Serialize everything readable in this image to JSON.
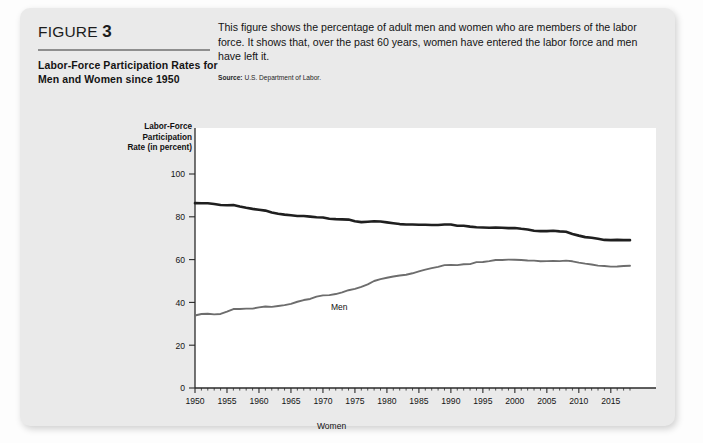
{
  "figure": {
    "kicker_label": "FIGURE",
    "kicker_number": "3",
    "title": "Labor-Force Participation Rates for Men and Women since 1950",
    "blurb": "This figure shows the percentage of adult men and women who are members of the labor force. It shows that, over the past 60 years, women have entered the labor force and men have left it.",
    "source_label": "Source:",
    "source_text": "U.S. Department of Labor."
  },
  "chart_data": {
    "type": "line",
    "title": "Labor-Force Participation Rates for Men and Women since 1950",
    "xlabel": "",
    "ylabel": "Labor-Force Participation Rate (in percent)",
    "ylabel_lines": [
      "Labor-Force",
      "Participation",
      "Rate (in percent)"
    ],
    "xlim": [
      1950,
      2018
    ],
    "ylim": [
      0,
      100
    ],
    "yticks": [
      0,
      20,
      40,
      60,
      80,
      100
    ],
    "ytick_labels": [
      "0",
      "20",
      "40",
      "60",
      "80",
      "100"
    ],
    "xticks": [
      1950,
      1955,
      1960,
      1965,
      1970,
      1975,
      1980,
      1985,
      1990,
      1995,
      2000,
      2005,
      2010,
      2015
    ],
    "xtick_labels": [
      "1950",
      "1955",
      "1960",
      "1965",
      "1970",
      "1975",
      "1980",
      "1985",
      "1990",
      "1995",
      "2000",
      "2005",
      "2010",
      "2015"
    ],
    "minor_xticks_every": 1,
    "grid": false,
    "legend": "inline-annotations",
    "annotations": [
      {
        "text": "Men",
        "x": 1973,
        "y": 85
      },
      {
        "text": "Women",
        "x": 1969,
        "y": 44
      }
    ],
    "x": [
      1950,
      1951,
      1952,
      1953,
      1954,
      1955,
      1956,
      1957,
      1958,
      1959,
      1960,
      1961,
      1962,
      1963,
      1964,
      1965,
      1966,
      1967,
      1968,
      1969,
      1970,
      1971,
      1972,
      1973,
      1974,
      1975,
      1976,
      1977,
      1978,
      1979,
      1980,
      1981,
      1982,
      1983,
      1984,
      1985,
      1986,
      1987,
      1988,
      1989,
      1990,
      1991,
      1992,
      1993,
      1994,
      1995,
      1996,
      1997,
      1998,
      1999,
      2000,
      2001,
      2002,
      2003,
      2004,
      2005,
      2006,
      2007,
      2008,
      2009,
      2010,
      2011,
      2012,
      2013,
      2014,
      2015,
      2016,
      2017,
      2018
    ],
    "series": [
      {
        "name": "Men",
        "color": "#1f1f1f",
        "values": [
          86.4,
          86.3,
          86.3,
          86.0,
          85.5,
          85.4,
          85.5,
          84.8,
          84.2,
          83.7,
          83.3,
          82.9,
          82.0,
          81.4,
          81.0,
          80.7,
          80.4,
          80.4,
          80.1,
          79.8,
          79.7,
          79.1,
          78.9,
          78.8,
          78.7,
          77.9,
          77.5,
          77.7,
          77.9,
          77.8,
          77.4,
          77.0,
          76.6,
          76.4,
          76.4,
          76.3,
          76.3,
          76.2,
          76.2,
          76.4,
          76.4,
          75.8,
          75.8,
          75.4,
          75.1,
          75.0,
          74.9,
          75.0,
          74.9,
          74.7,
          74.8,
          74.4,
          74.1,
          73.5,
          73.3,
          73.3,
          73.5,
          73.2,
          73.0,
          72.0,
          71.2,
          70.5,
          70.2,
          69.7,
          69.2,
          69.1,
          69.2,
          69.1,
          69.1
        ]
      },
      {
        "name": "Women",
        "color": "#6d6d6d",
        "values": [
          33.9,
          34.6,
          34.7,
          34.4,
          34.6,
          35.7,
          36.9,
          36.9,
          37.1,
          37.1,
          37.7,
          38.1,
          37.9,
          38.3,
          38.7,
          39.3,
          40.3,
          41.1,
          41.6,
          42.7,
          43.3,
          43.4,
          43.9,
          44.7,
          45.7,
          46.3,
          47.3,
          48.4,
          50.0,
          50.9,
          51.5,
          52.1,
          52.6,
          52.9,
          53.6,
          54.5,
          55.3,
          56.0,
          56.6,
          57.4,
          57.5,
          57.4,
          57.8,
          57.9,
          58.8,
          58.9,
          59.3,
          59.8,
          59.8,
          60.0,
          59.9,
          59.8,
          59.6,
          59.5,
          59.2,
          59.3,
          59.4,
          59.3,
          59.5,
          59.2,
          58.6,
          58.1,
          57.7,
          57.2,
          57.0,
          56.7,
          56.8,
          57.0,
          57.1
        ]
      }
    ]
  }
}
